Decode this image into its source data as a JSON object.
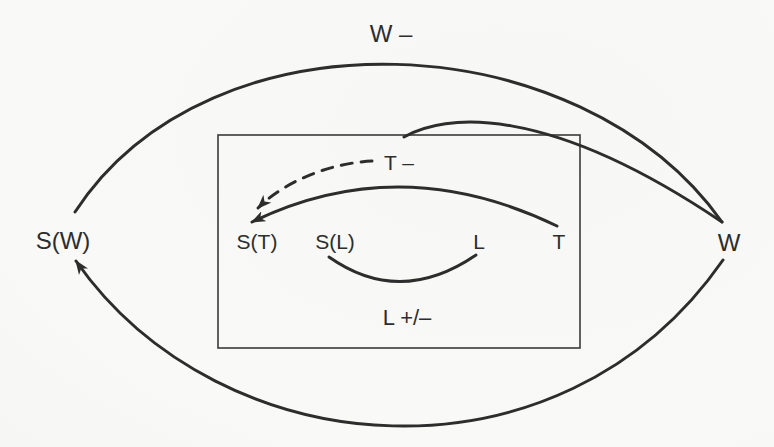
{
  "figure": {
    "background_color": "#f9f9f7",
    "ink_color": "#2d2d2d",
    "labels": {
      "w_minus": "W –",
      "s_w": "S(W)",
      "w": "W",
      "t_minus": "T –",
      "s_t": "S(T)",
      "s_l": "S(L)",
      "l": "L",
      "t": "T",
      "l_plus_minus": "L +/–"
    }
  }
}
